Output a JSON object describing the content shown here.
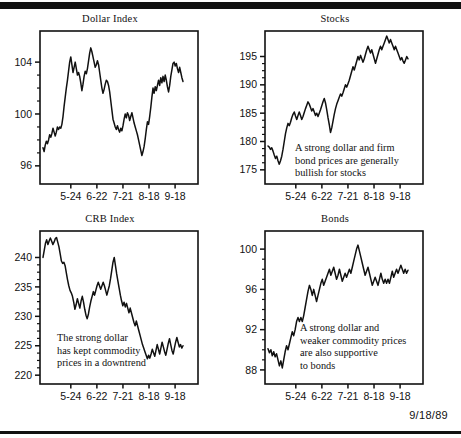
{
  "page": {
    "datestamp": "9/18/89",
    "ink_color": "#111111",
    "background_color": "#ffffff"
  },
  "chart_data": [
    {
      "type": "line",
      "id": "dollar-index",
      "title": "Dollar Index",
      "xlabel": "",
      "ylabel": "",
      "grid": false,
      "legend": null,
      "xticklabels": [
        "5-24",
        "6-22",
        "7-21",
        "8-18",
        "9-18"
      ],
      "xtickpos": [
        0.195,
        0.36,
        0.525,
        0.69,
        0.855
      ],
      "yticklabels": [
        "96",
        "100",
        "104"
      ],
      "ytickvalues": [
        96,
        100,
        104
      ],
      "yminorstep": 1,
      "ylim": [
        94.6,
        106.4
      ],
      "annotation": null,
      "values": [
        97.4,
        97.1,
        97.6,
        97.9,
        97.7,
        98.0,
        98.4,
        98.2,
        98.5,
        98.9,
        98.6,
        98.3,
        98.6,
        99.0,
        98.8,
        99.0,
        98.9,
        99.2,
        99.8,
        100.6,
        101.3,
        102.0,
        102.6,
        103.3,
        104.0,
        104.4,
        103.8,
        103.2,
        103.6,
        104.0,
        103.5,
        103.0,
        103.2,
        102.9,
        102.4,
        101.8,
        102.3,
        102.9,
        103.3,
        103.1,
        103.5,
        104.1,
        104.7,
        105.1,
        104.8,
        104.4,
        104.0,
        103.6,
        103.8,
        104.1,
        103.8,
        103.2,
        102.6,
        102.0,
        101.6,
        101.9,
        102.3,
        102.6,
        102.5,
        102.2,
        101.7,
        101.0,
        100.3,
        99.6,
        99.3,
        99.0,
        98.8,
        99.1,
        98.8,
        98.6,
        98.9,
        98.7,
        99.1,
        99.6,
        100.0,
        99.7,
        100.1,
        99.9,
        99.5,
        99.8,
        100.1,
        99.7,
        99.3,
        99.0,
        98.7,
        98.4,
        98.0,
        97.6,
        97.2,
        96.8,
        97.1,
        97.5,
        98.1,
        98.8,
        99.4,
        99.2,
        99.8,
        100.5,
        101.3,
        102.0,
        101.6,
        102.1,
        101.8,
        102.2,
        102.6,
        102.2,
        102.8,
        102.4,
        102.9,
        102.5,
        103.0,
        102.6,
        102.1,
        101.7,
        102.2,
        102.9,
        103.4,
        103.9,
        104.0,
        103.7,
        103.9,
        103.5,
        103.2,
        103.6,
        103.2,
        102.8,
        102.5
      ]
    },
    {
      "type": "line",
      "id": "stocks",
      "title": "Stocks",
      "xlabel": "",
      "ylabel": "",
      "grid": false,
      "legend": null,
      "xticklabels": [
        "5-24",
        "6-22",
        "7-21",
        "8-18",
        "9-18"
      ],
      "xtickpos": [
        0.195,
        0.36,
        0.525,
        0.69,
        0.855
      ],
      "yticklabels": [
        "175",
        "180",
        "185",
        "190",
        "195"
      ],
      "ytickvalues": [
        175,
        180,
        185,
        190,
        195
      ],
      "yminorstep": 1,
      "ylim": [
        172.5,
        199.5
      ],
      "annotation": {
        "lines": [
          "A strong dollar and firm",
          "bond prices are generally",
          "bullish for stocks"
        ],
        "text": "A strong dollar and firm\nbond prices are generally\nbullish for stocks"
      },
      "values": [
        179.2,
        179.0,
        178.6,
        178.9,
        178.3,
        177.6,
        177.0,
        177.4,
        176.6,
        176.0,
        176.6,
        177.4,
        178.6,
        180.0,
        181.4,
        182.4,
        183.2,
        182.8,
        183.4,
        184.2,
        184.8,
        185.2,
        184.5,
        183.9,
        184.6,
        185.2,
        184.6,
        183.9,
        184.4,
        185.1,
        185.8,
        186.4,
        187.0,
        186.6,
        186.0,
        185.4,
        185.8,
        185.2,
        184.6,
        185.0,
        184.4,
        185.0,
        185.6,
        186.3,
        187.0,
        187.6,
        186.8,
        185.6,
        184.2,
        183.0,
        181.6,
        182.4,
        183.6,
        184.8,
        185.8,
        186.6,
        187.2,
        187.8,
        188.4,
        188.0,
        188.6,
        189.3,
        190.0,
        189.6,
        190.2,
        190.8,
        191.6,
        192.4,
        193.2,
        192.6,
        193.4,
        194.2,
        195.0,
        194.4,
        195.2,
        194.6,
        194.0,
        194.6,
        195.4,
        196.2,
        196.8,
        196.2,
        195.6,
        196.2,
        195.4,
        194.6,
        193.8,
        194.6,
        195.4,
        196.2,
        196.8,
        196.2,
        196.8,
        197.4,
        198.0,
        198.6,
        198.0,
        197.4,
        198.0,
        197.4,
        196.8,
        196.2,
        196.8,
        196.2,
        195.6,
        195.0,
        194.4,
        194.8,
        194.2,
        193.8,
        194.4,
        195.0,
        194.6
      ]
    },
    {
      "type": "line",
      "id": "crb-index",
      "title": "CRB Index",
      "xlabel": "",
      "ylabel": "",
      "grid": false,
      "legend": null,
      "xticklabels": [
        "5-24",
        "6-22",
        "7-21",
        "8-18",
        "9-18"
      ],
      "xtickpos": [
        0.195,
        0.36,
        0.525,
        0.69,
        0.855
      ],
      "yticklabels": [
        "220",
        "225",
        "230",
        "235",
        "240"
      ],
      "ytickvalues": [
        220,
        225,
        230,
        235,
        240
      ],
      "yminorstep": 1,
      "ylim": [
        218.5,
        244.5
      ],
      "annotation": {
        "lines": [
          "The strong dollar",
          "has kept commodity",
          "prices in a downtrend"
        ],
        "text": "The strong dollar\nhas kept commodity\nprices in a downtrend"
      },
      "values": [
        240.0,
        241.2,
        242.4,
        243.0,
        242.2,
        242.8,
        243.3,
        242.8,
        242.2,
        242.6,
        243.2,
        243.4,
        242.6,
        241.8,
        240.6,
        239.4,
        239.0,
        239.2,
        238.6,
        237.4,
        236.2,
        235.2,
        234.4,
        234.0,
        233.4,
        232.4,
        231.2,
        232.0,
        233.0,
        232.2,
        231.4,
        232.6,
        233.4,
        232.4,
        231.2,
        230.2,
        229.6,
        230.4,
        231.6,
        232.6,
        233.4,
        234.2,
        233.6,
        234.4,
        235.2,
        235.8,
        235.2,
        234.6,
        235.2,
        235.8,
        235.2,
        234.4,
        233.6,
        234.4,
        235.2,
        236.4,
        237.8,
        239.2,
        240.0,
        238.6,
        237.2,
        236.0,
        234.8,
        233.6,
        232.6,
        231.8,
        232.4,
        231.6,
        232.2,
        231.4,
        230.6,
        231.4,
        230.6,
        229.8,
        229.0,
        228.4,
        229.2,
        228.4,
        227.6,
        226.8,
        226.0,
        225.2,
        224.6,
        224.0,
        223.4,
        222.8,
        223.4,
        222.9,
        223.6,
        224.4,
        223.8,
        223.2,
        224.2,
        225.2,
        224.4,
        223.6,
        224.6,
        225.6,
        224.8,
        224.0,
        223.4,
        224.4,
        225.4,
        226.2,
        225.2,
        224.2,
        223.6,
        224.6,
        225.6,
        226.4,
        225.6,
        224.8,
        225.2,
        224.6,
        225.0
      ]
    },
    {
      "type": "line",
      "id": "bonds",
      "title": "Bonds",
      "xlabel": "",
      "ylabel": "",
      "grid": false,
      "legend": null,
      "xticklabels": [
        "5-24",
        "6-22",
        "7-21",
        "8-18",
        "9-18"
      ],
      "xtickpos": [
        0.195,
        0.36,
        0.525,
        0.69,
        0.855
      ],
      "yticklabels": [
        "88",
        "92",
        "96",
        "100"
      ],
      "ytickvalues": [
        88,
        92,
        96,
        100
      ],
      "yminorstep": 1,
      "ylim": [
        86.6,
        101.8
      ],
      "annotation": {
        "lines": [
          "A strong dollar and",
          "weaker commodity prices",
          "are also supportive",
          "to bonds"
        ],
        "text": "A strong dollar and\nweaker commodity prices\nare also supportive\nto bonds"
      },
      "values": [
        90.1,
        89.7,
        90.0,
        89.4,
        89.8,
        89.3,
        89.6,
        89.0,
        88.4,
        88.9,
        88.2,
        89.0,
        89.8,
        90.4,
        90.0,
        90.6,
        91.2,
        91.8,
        91.4,
        92.0,
        92.8,
        93.2,
        92.8,
        93.2,
        92.8,
        93.4,
        94.2,
        95.0,
        95.8,
        96.4,
        96.0,
        95.4,
        96.0,
        95.4,
        94.8,
        95.4,
        96.0,
        96.6,
        97.0,
        96.4,
        96.8,
        97.2,
        97.6,
        98.0,
        97.4,
        97.8,
        98.2,
        97.6,
        97.0,
        97.4,
        98.0,
        97.4,
        96.8,
        97.2,
        97.6,
        97.2,
        97.6,
        98.0,
        97.6,
        98.2,
        98.8,
        99.4,
        100.0,
        100.4,
        99.8,
        99.2,
        98.6,
        98.0,
        97.4,
        97.8,
        98.2,
        97.6,
        97.0,
        96.4,
        96.8,
        97.2,
        96.8,
        96.4,
        97.0,
        97.6,
        97.0,
        96.6,
        97.0,
        96.6,
        97.0,
        96.6,
        97.2,
        97.8,
        97.2,
        97.6,
        98.0,
        97.6,
        98.0,
        98.4,
        98.0,
        97.6,
        98.0,
        97.6,
        97.9
      ]
    }
  ]
}
